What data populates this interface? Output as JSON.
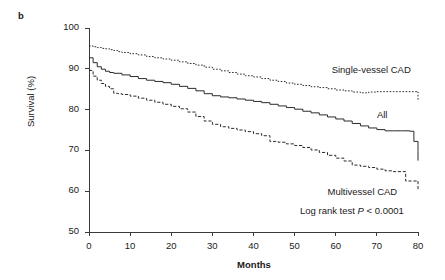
{
  "figure": {
    "panel_label": "b",
    "stat_note_prefix": "Log rank test ",
    "stat_note_italic": "P",
    "stat_note_suffix": " < 0.0001"
  },
  "chart_data": {
    "type": "line",
    "title": "",
    "xlabel": "Months",
    "ylabel": "Survival (%)",
    "xlim": [
      0,
      80
    ],
    "ylim": [
      50,
      100
    ],
    "xticks": [
      0,
      10,
      20,
      30,
      40,
      50,
      60,
      70,
      80
    ],
    "yticks": [
      50,
      60,
      70,
      80,
      90,
      100
    ],
    "grid": false,
    "legend_position": "inline-annotations",
    "step_type": "kaplan-meier",
    "annotations": [
      {
        "text": "Log rank test P < 0.0001",
        "x": 46,
        "y": 55
      }
    ],
    "series": [
      {
        "name": "Single-vessel CAD",
        "label": "Single-vessel CAD",
        "style": "dotted",
        "color": "#2b2b2b",
        "label_x": 59,
        "label_y": 89.5,
        "x": [
          0,
          1,
          2,
          3,
          4,
          5,
          6,
          7,
          8,
          10,
          12,
          14,
          16,
          18,
          20,
          22,
          24,
          26,
          28,
          30,
          32,
          34,
          36,
          38,
          40,
          42,
          44,
          46,
          48,
          50,
          52,
          54,
          56,
          58,
          60,
          62,
          64,
          66,
          68,
          70,
          72,
          74,
          76,
          77,
          80
        ],
        "y": [
          95.6,
          95.4,
          95.2,
          95.0,
          94.9,
          94.7,
          94.5,
          94.2,
          94.0,
          93.7,
          93.4,
          93.0,
          92.7,
          92.4,
          92.1,
          91.7,
          91.3,
          90.9,
          90.4,
          89.9,
          89.5,
          89.1,
          88.7,
          88.3,
          88.0,
          87.6,
          87.2,
          86.9,
          86.5,
          86.2,
          85.9,
          85.6,
          85.4,
          85.1,
          84.8,
          84.6,
          84.3,
          84.1,
          84.3,
          84.4,
          84.4,
          84.4,
          84.4,
          84.4,
          84.4
        ]
      },
      {
        "name": "All",
        "label": "All",
        "style": "solid",
        "color": "#2b2b2b",
        "label_x": 70,
        "label_y": 78.5,
        "x": [
          0,
          1,
          2,
          3,
          4,
          5,
          6,
          8,
          10,
          12,
          14,
          16,
          18,
          20,
          22,
          24,
          26,
          28,
          30,
          32,
          34,
          36,
          38,
          40,
          42,
          44,
          46,
          48,
          50,
          52,
          54,
          56,
          58,
          60,
          62,
          64,
          66,
          68,
          70,
          72,
          74,
          76,
          78,
          79,
          80
        ],
        "y": [
          92.7,
          91.5,
          90.5,
          89.9,
          89.4,
          89.1,
          88.9,
          88.5,
          88.1,
          87.6,
          87.2,
          86.9,
          86.6,
          86.2,
          85.7,
          85.2,
          84.6,
          83.9,
          83.4,
          83.1,
          82.9,
          82.6,
          82.3,
          82.0,
          81.7,
          81.3,
          80.9,
          80.5,
          80.1,
          79.6,
          79.2,
          78.7,
          78.2,
          77.7,
          77.2,
          76.6,
          76.0,
          75.5,
          75.1,
          74.8,
          74.8,
          74.8,
          74.7,
          72.2,
          69.7
        ]
      },
      {
        "name": "Multivessel CAD",
        "label": "Multivessel CAD",
        "style": "dashed",
        "color": "#2b2b2b",
        "label_x": 58,
        "label_y": 59.5,
        "x": [
          0,
          1,
          2,
          3,
          4,
          5,
          6,
          7,
          8,
          10,
          12,
          14,
          16,
          18,
          20,
          22,
          24,
          26,
          28,
          30,
          32,
          34,
          36,
          38,
          40,
          42,
          44,
          46,
          48,
          50,
          52,
          54,
          56,
          58,
          60,
          62,
          64,
          66,
          68,
          70,
          72,
          74,
          76,
          77,
          80
        ],
        "y": [
          89.6,
          88.2,
          87.2,
          86.4,
          85.7,
          85.1,
          84.0,
          83.9,
          83.7,
          83.3,
          82.8,
          82.3,
          81.8,
          81.3,
          80.8,
          80.2,
          79.4,
          78.3,
          77.2,
          76.4,
          75.8,
          75.4,
          75.0,
          74.6,
          74.1,
          73.6,
          72.2,
          72.0,
          71.6,
          71.2,
          70.7,
          70.1,
          69.5,
          68.8,
          68.1,
          67.4,
          66.4,
          66.1,
          65.8,
          65.4,
          65.0,
          64.8,
          64.8,
          62.5,
          62.5
        ]
      }
    ]
  }
}
